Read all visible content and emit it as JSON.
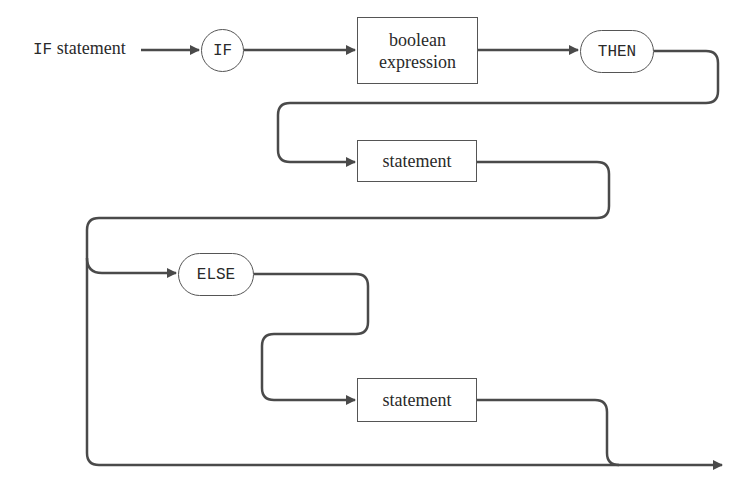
{
  "diagram": {
    "type": "syntax-diagram",
    "entry_label": {
      "keyword": "IF",
      "rest": " statement"
    },
    "nodes": [
      {
        "id": "if",
        "kind": "terminal-circle",
        "text": "IF"
      },
      {
        "id": "cond",
        "kind": "nonterminal-box",
        "line1": "boolean",
        "line2": "expression"
      },
      {
        "id": "then",
        "kind": "terminal-pill",
        "text": "THEN"
      },
      {
        "id": "stmt1",
        "kind": "nonterminal-box",
        "text": "statement"
      },
      {
        "id": "else",
        "kind": "terminal-pill",
        "text": "ELSE"
      },
      {
        "id": "stmt2",
        "kind": "nonterminal-box",
        "text": "statement"
      }
    ],
    "colors": {
      "line": "#4a4a4a",
      "text": "#2a2a2a",
      "background": "#ffffff"
    }
  }
}
